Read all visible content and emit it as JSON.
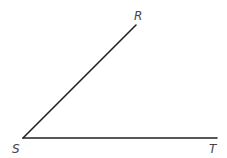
{
  "diagram": {
    "type": "angle",
    "vertex": {
      "label": "S",
      "x": 23,
      "y": 138
    },
    "points": [
      {
        "label": "R",
        "x": 136,
        "y": 25
      },
      {
        "label": "T",
        "x": 217,
        "y": 138
      }
    ],
    "rays": [
      {
        "from": "S",
        "to": "R"
      },
      {
        "from": "S",
        "to": "T"
      }
    ],
    "line_color": "#222222",
    "label_color": "#444444"
  }
}
